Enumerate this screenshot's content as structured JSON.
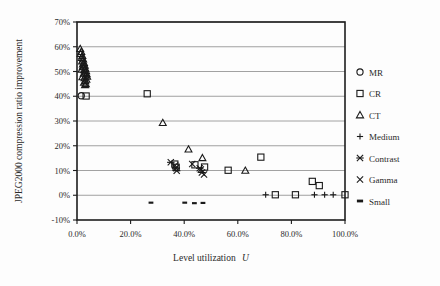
{
  "figure": {
    "background": "#fdfdfd",
    "frame_color": "#1d1d1d",
    "grid_color": "#8a8a8a",
    "marker_color": "#1a1a1a"
  },
  "chart_data": {
    "type": "scatter",
    "title": "",
    "xlabel": "Level utilization U",
    "xlabel_plain": "Level utilization",
    "xlabel_italic": "U",
    "ylabel": "JPEG2000 compression ratio improvement",
    "xlim": [
      0,
      100
    ],
    "ylim": [
      -10,
      70
    ],
    "grid": true,
    "grid_axis": "y",
    "legend_position": "right",
    "xticks": [
      0,
      20,
      40,
      60,
      80,
      100
    ],
    "xticklabels": [
      "0.0%",
      "20.0%",
      "40.0%",
      "60.0%",
      "80.0%",
      "100.0%"
    ],
    "yticks": [
      -10,
      0,
      10,
      20,
      30,
      40,
      50,
      60,
      70
    ],
    "yticklabels": [
      "-10%",
      "0%",
      "10%",
      "20%",
      "30%",
      "40%",
      "50%",
      "60%",
      "70%"
    ],
    "series": [
      {
        "name": "MR",
        "marker": "circle",
        "points": [
          [
            1.6,
            40.2
          ]
        ]
      },
      {
        "name": "CR",
        "marker": "square",
        "points": [
          [
            3.4,
            40.1
          ],
          [
            26.2,
            41.0
          ],
          [
            36.5,
            12.6
          ],
          [
            37.0,
            11.3
          ],
          [
            44.0,
            12.3
          ],
          [
            47.6,
            11.4
          ],
          [
            56.4,
            10.1
          ],
          [
            68.6,
            15.4
          ],
          [
            74.0,
            0.2
          ],
          [
            81.5,
            0.2
          ],
          [
            87.8,
            5.6
          ],
          [
            90.4,
            3.9
          ],
          [
            100.0,
            0.2
          ]
        ]
      },
      {
        "name": "CT",
        "marker": "triangle",
        "points": [
          [
            1.2,
            59.2
          ],
          [
            1.6,
            58.0
          ],
          [
            1.4,
            57.2
          ],
          [
            2.0,
            56.4
          ],
          [
            1.8,
            55.6
          ],
          [
            2.3,
            55.0
          ],
          [
            1.9,
            54.2
          ],
          [
            2.6,
            53.6
          ],
          [
            2.2,
            53.0
          ],
          [
            2.9,
            52.4
          ],
          [
            2.4,
            51.8
          ],
          [
            3.1,
            51.2
          ],
          [
            2.7,
            50.6
          ],
          [
            3.4,
            50.2
          ],
          [
            3.0,
            49.6
          ],
          [
            3.6,
            49.0
          ],
          [
            3.2,
            48.4
          ],
          [
            3.8,
            48.0
          ],
          [
            2.8,
            47.4
          ],
          [
            3.5,
            46.8
          ],
          [
            3.1,
            46.2
          ],
          [
            2.6,
            45.6
          ],
          [
            3.3,
            45.0
          ],
          [
            2.2,
            52.0
          ],
          [
            1.7,
            50.8
          ],
          [
            2.5,
            49.2
          ],
          [
            2.0,
            47.8
          ],
          [
            3.0,
            44.6
          ],
          [
            32.0,
            29.3
          ],
          [
            41.6,
            18.6
          ],
          [
            46.8,
            15.1
          ],
          [
            62.8,
            10.0
          ]
        ]
      },
      {
        "name": "Medium",
        "marker": "plus",
        "points": [
          [
            70.4,
            0.2
          ],
          [
            88.6,
            0.2
          ],
          [
            92.4,
            0.2
          ],
          [
            95.6,
            0.2
          ]
        ]
      },
      {
        "name": "Contrast",
        "marker": "asterisk",
        "points": [
          [
            35.0,
            13.3
          ],
          [
            36.9,
            11.0
          ],
          [
            37.2,
            9.9
          ],
          [
            45.8,
            10.9
          ],
          [
            46.6,
            9.2
          ]
        ]
      },
      {
        "name": "Gamma",
        "marker": "cross",
        "points": [
          [
            36.6,
            12.0
          ],
          [
            43.0,
            12.6
          ],
          [
            46.2,
            10.4
          ],
          [
            47.4,
            8.4
          ]
        ]
      },
      {
        "name": "Small",
        "marker": "dash",
        "points": [
          [
            27.6,
            -3.0
          ],
          [
            40.2,
            -3.0
          ],
          [
            43.8,
            -3.2
          ],
          [
            47.0,
            -3.1
          ]
        ]
      }
    ]
  },
  "legend": {
    "entries": [
      {
        "label": "MR",
        "marker": "circle"
      },
      {
        "label": "CR",
        "marker": "square"
      },
      {
        "label": "CT",
        "marker": "triangle"
      },
      {
        "label": "Medium",
        "marker": "plus"
      },
      {
        "label": "Contrast",
        "marker": "asterisk"
      },
      {
        "label": "Gamma",
        "marker": "cross"
      },
      {
        "label": "Small",
        "marker": "dash"
      }
    ]
  }
}
